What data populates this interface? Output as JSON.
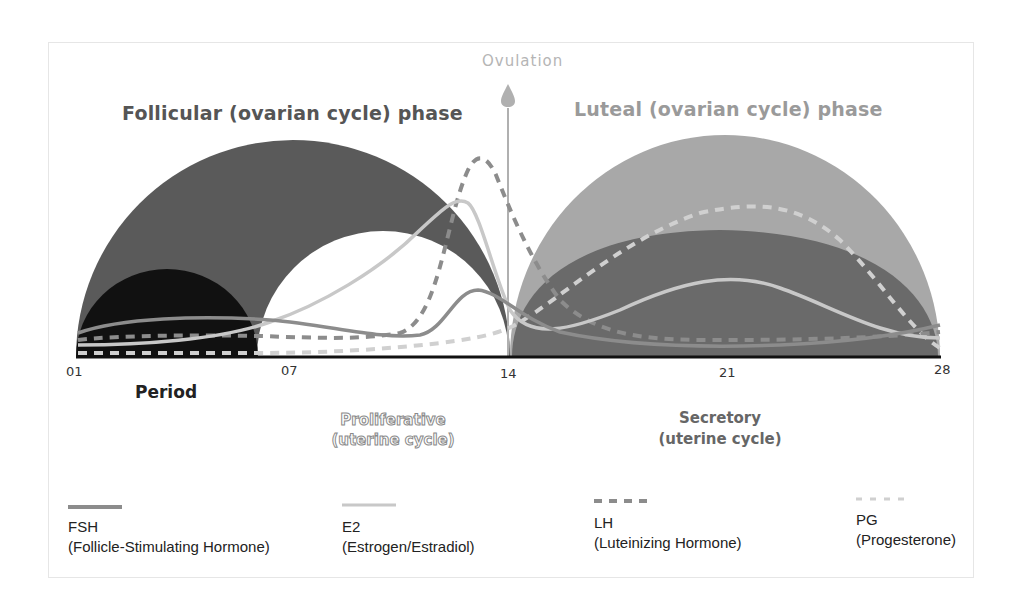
{
  "phases": {
    "follicular_title": "Follicular (ovarian cycle) phase",
    "luteal_title": "Luteal (ovarian cycle) phase",
    "ovulation_label": "Ovulation"
  },
  "axis": {
    "ticks": [
      "01",
      "07",
      "14",
      "21",
      "28"
    ]
  },
  "uterine": {
    "period_label": "Period",
    "proliferative_line1": "Proliferative",
    "proliferative_line2": "(uterine cycle)",
    "secretory_line1": "Secretory",
    "secretory_line2": "(uterine cycle)"
  },
  "legend": [
    {
      "abbr": "FSH",
      "full": "(Follicle-Stimulating Hormone)",
      "style": "solid",
      "color": "#8c8c8c"
    },
    {
      "abbr": "E2",
      "full": "(Estrogen/Estradiol)",
      "style": "solid",
      "color": "#c8c8c8"
    },
    {
      "abbr": "LH",
      "full": "(Luteinizing Hormone)",
      "style": "dashed",
      "color": "#8c8c8c"
    },
    {
      "abbr": "PG",
      "full": "(Progesterone)",
      "style": "dashed",
      "color": "#d0d0d0"
    }
  ],
  "colors": {
    "follicular_fill": "#5a5a5a",
    "period_fill": "#111111",
    "luteal_outer_fill": "#a8a8a8",
    "luteal_inner_fill": "#6a6a6a",
    "ovulation_line": "#b0b0b0"
  }
}
